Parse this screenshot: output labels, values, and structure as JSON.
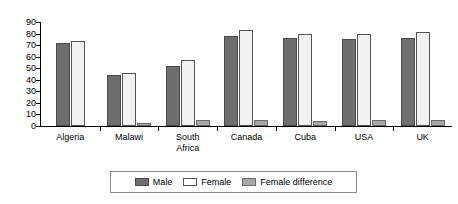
{
  "chart_data": {
    "type": "bar",
    "title": "",
    "subtitle": "",
    "xlabel": "",
    "ylabel": "",
    "ylim": [
      0,
      90
    ],
    "ytick_step": 10,
    "yticks": [
      "0",
      "10",
      "20",
      "30",
      "40",
      "50",
      "60",
      "70",
      "80",
      "90"
    ],
    "grid": false,
    "legend_position": "bottom",
    "categories": [
      "Algeria",
      "Malawi",
      "South\nAfrica",
      "Canada",
      "Cuba",
      "USA",
      "UK"
    ],
    "series": [
      {
        "name": "Male",
        "color": "#6e6e6e",
        "values": [
          72,
          44,
          52,
          78,
          76,
          75,
          76
        ]
      },
      {
        "name": "Female",
        "color": "#f2f2f2",
        "values": [
          74,
          46,
          57,
          83,
          80,
          80,
          81
        ]
      },
      {
        "name": "Female difference",
        "color": "#a8a8a8",
        "values": [
          0,
          3,
          5,
          5,
          4,
          5,
          5
        ]
      }
    ]
  },
  "legend": {
    "items": [
      {
        "label": "Male",
        "swatch": "male-swatch"
      },
      {
        "label": "Female",
        "swatch": "female-swatch"
      },
      {
        "label": "Female difference",
        "swatch": "female-difference-swatch"
      }
    ]
  },
  "colors": {
    "male": "#6e6e6e",
    "female": "#f2f2f2",
    "female_difference": "#a8a8a8",
    "axis": "#000000",
    "background": "#ffffff"
  }
}
